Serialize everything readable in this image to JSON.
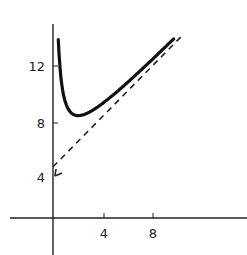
{
  "chart_data": {
    "type": "line",
    "title": "",
    "xlabel": "",
    "ylabel": "",
    "xlim": [
      -3.5,
      15.5
    ],
    "ylim": [
      -2.5,
      14.8
    ],
    "grid": false,
    "legend": null,
    "x_ticks": [
      4,
      8
    ],
    "x_tick_labels": [
      "4",
      "8"
    ],
    "y_ticks": [
      4,
      8,
      12
    ],
    "y_tick_labels": [
      "4",
      "8",
      "12"
    ],
    "series": [
      {
        "name": "curve",
        "style": "solid-thick",
        "description": "y = x + 4 + 4/x (approx.), minimum near (2, 8)",
        "x": [
          0.27,
          0.4,
          0.6,
          0.8,
          1.0,
          1.3,
          1.6,
          2.0,
          2.5,
          3.0,
          4.0,
          5.0,
          6.0,
          7.0,
          8.0,
          9.0,
          9.6
        ],
        "y": [
          14.5,
          14.4,
          11.27,
          9.8,
          9.0,
          8.38,
          8.1,
          8.0,
          8.1,
          8.33,
          9.0,
          9.8,
          10.67,
          11.57,
          12.5,
          13.44,
          14.0
        ]
      },
      {
        "name": "asymptote",
        "style": "dashed",
        "description": "y = x + 4",
        "x": [
          0,
          10.3
        ],
        "y": [
          4,
          14.3
        ]
      }
    ],
    "annotations": [
      {
        "type": "arrowhead",
        "at": [
          0,
          4
        ],
        "series": "asymptote"
      }
    ]
  },
  "axes": {
    "x_tick_labels": [
      "4",
      "8"
    ],
    "y_tick_labels": [
      "4",
      "8",
      "12"
    ]
  }
}
